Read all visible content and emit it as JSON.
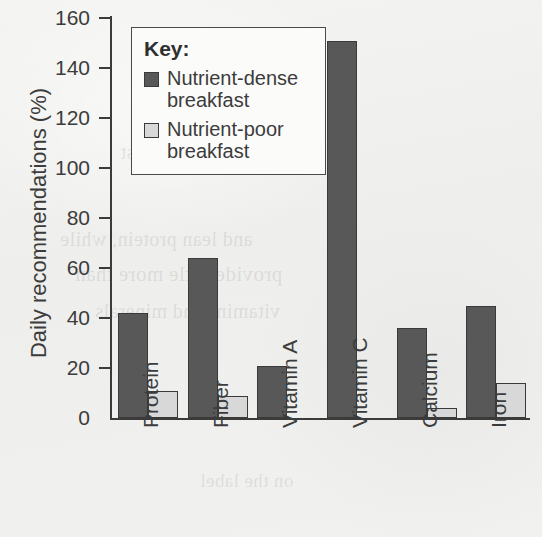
{
  "chart_data": {
    "type": "bar",
    "title": "",
    "xlabel": "",
    "ylabel": "Daily recommendations (%)",
    "ylim": [
      0,
      160
    ],
    "yticks": [
      0,
      20,
      40,
      60,
      80,
      100,
      120,
      140,
      160
    ],
    "grid": false,
    "legend_position": "upper-left-inside",
    "categories": [
      "Protein",
      "Fiber",
      "Vitamin A",
      "Vitamin C",
      "Calcium",
      "Iron"
    ],
    "series": [
      {
        "name": "Nutrient-dense breakfast",
        "color": "#585858",
        "values": [
          42,
          64,
          21,
          151,
          36,
          45
        ]
      },
      {
        "name": "Nutrient-poor breakfast",
        "color": "#d8d8d8",
        "values": [
          11,
          9,
          0,
          0,
          4,
          14
        ]
      }
    ]
  },
  "legend": {
    "title": "Key:",
    "items": [
      {
        "label_line1": "Nutrient-dense",
        "label_line2": "breakfast",
        "swatch": "dense"
      },
      {
        "label_line1": "Nutrient-poor",
        "label_line2": "breakfast",
        "swatch": "poor"
      }
    ]
  },
  "ghost_text": [
    "the morning meal",
    "a nutrient-dense breakfast",
    "and lean protein, while",
    "provide little more than",
    "vitamins and minerals",
    "on the label"
  ]
}
